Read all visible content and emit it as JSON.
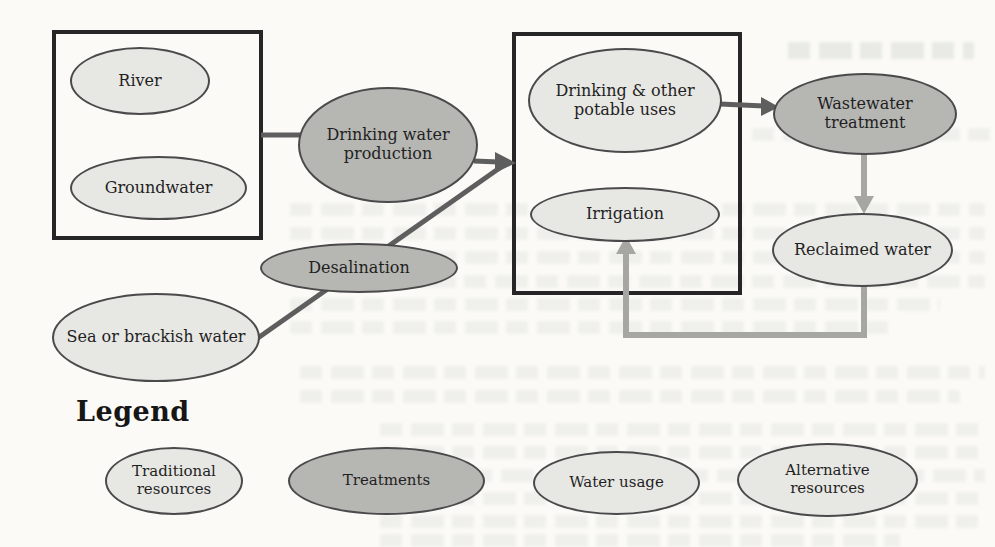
{
  "figure": {
    "nodes": {
      "river": {
        "label": "River",
        "category": "traditional-resource"
      },
      "groundwater": {
        "label": "Groundwater",
        "category": "traditional-resource"
      },
      "drinking_water_production": {
        "label": "Drinking water production",
        "category": "treatment"
      },
      "desalination": {
        "label": "Desalination",
        "category": "treatment"
      },
      "sea_or_brackish_water": {
        "label": "Sea or brackish water",
        "category": "alternative-resource"
      },
      "drinking_other_potable_uses": {
        "label": "Drinking & other potable uses",
        "category": "water-usage"
      },
      "irrigation": {
        "label": "Irrigation",
        "category": "water-usage"
      },
      "wastewater_treatment": {
        "label": "Wastewater treatment",
        "category": "treatment"
      },
      "reclaimed_water": {
        "label": "Reclaimed water",
        "category": "alternative-resource"
      }
    },
    "edges": [
      {
        "from": "river+groundwater-box",
        "to": "drinking_water_production",
        "style": "dark-line"
      },
      {
        "from": "drinking_water_production",
        "to": "usage-box",
        "style": "dark-arrow"
      },
      {
        "from": "sea_or_brackish_water",
        "to": "desalination",
        "style": "dark-line"
      },
      {
        "from": "desalination",
        "to": "usage-box",
        "style": "dark-arrow"
      },
      {
        "from": "drinking_other_potable_uses",
        "to": "wastewater_treatment",
        "style": "dark-arrow"
      },
      {
        "from": "wastewater_treatment",
        "to": "reclaimed_water",
        "style": "gray-arrow"
      },
      {
        "from": "reclaimed_water",
        "to": "irrigation",
        "style": "gray-elbow-arrow"
      }
    ],
    "legend": {
      "title": "Legend",
      "items": [
        {
          "label": "Traditional resources",
          "style": "light"
        },
        {
          "label": "Treatments",
          "style": "dark"
        },
        {
          "label": "Water usage",
          "style": "light"
        },
        {
          "label": "Alternative resources",
          "style": "light"
        }
      ]
    },
    "colors": {
      "node_light": "#e7e7e4",
      "node_dark": "#b6b6b3",
      "node_border": "#4a4a4a",
      "box_border": "#262626",
      "arrow_dark": "#5e5e5e",
      "arrow_gray": "#a6a6a3",
      "paper": "#fbfaf7"
    }
  }
}
